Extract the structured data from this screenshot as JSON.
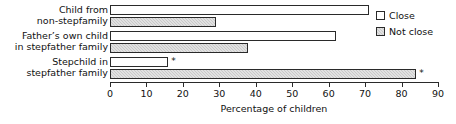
{
  "chart_data": {
    "type": "bar",
    "orientation": "horizontal",
    "title": "",
    "xlabel": "Percentage of children",
    "ylabel": "",
    "xlim": [
      0,
      90
    ],
    "xticks": [
      0,
      10,
      20,
      30,
      40,
      50,
      60,
      70,
      80,
      90
    ],
    "grid": false,
    "legend_position": "top-right",
    "categories": [
      "Child from\nnon-stepfamily",
      "Father’s own child\nin stepfather family",
      "Stepchild in\nstepfather family"
    ],
    "category_lines": [
      [
        "Child from",
        "non-stepfamily"
      ],
      [
        "Father’s own child",
        "in stepfather family"
      ],
      [
        "Stepchild in",
        "stepfather family"
      ]
    ],
    "series": [
      {
        "name": "Close",
        "color": "#ffffff",
        "values": [
          71,
          62,
          16
        ],
        "annotations": [
          "",
          "",
          "*"
        ]
      },
      {
        "name": "Not close",
        "color": "#c9c9c9",
        "values": [
          29,
          38,
          84
        ],
        "annotations": [
          "",
          "",
          "*"
        ]
      }
    ]
  },
  "legend": {
    "items": [
      {
        "label": "Close",
        "swatch": "close"
      },
      {
        "label": "Not close",
        "swatch": "notclose"
      }
    ]
  },
  "axis": {
    "tick_labels": [
      "0",
      "10",
      "20",
      "30",
      "40",
      "50",
      "60",
      "70",
      "80",
      "90"
    ],
    "title": "Percentage of children"
  }
}
